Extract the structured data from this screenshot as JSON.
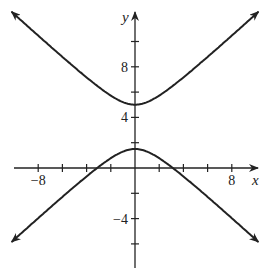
{
  "chart_data": {
    "type": "line",
    "title": "",
    "xlabel": "x",
    "ylabel": "y",
    "xlim": [
      -10.5,
      10.5
    ],
    "ylim": [
      -8,
      12.5
    ],
    "x_ticks": [
      -8,
      -6,
      -4,
      -2,
      2,
      4,
      6,
      8
    ],
    "y_ticks": [
      -6,
      -4,
      -2,
      2,
      4,
      6,
      8,
      10
    ],
    "x_tick_labels": [
      {
        "value": -8,
        "label": "−8"
      },
      {
        "value": 8,
        "label": "8"
      }
    ],
    "y_tick_labels": [
      {
        "value": 8,
        "label": "8"
      },
      {
        "value": 4,
        "label": "4"
      },
      {
        "value": -4,
        "label": "−4"
      }
    ],
    "grid": false,
    "series": [
      {
        "name": "upper branch",
        "description": "hyperbola branch opening upward, vertex (0,5)",
        "vertex": [
          0,
          5
        ]
      },
      {
        "name": "lower branch",
        "description": "hyperbola branch opening downward, vertex (0,1.5)",
        "vertex": [
          0,
          1.5
        ]
      }
    ],
    "hyperbola": {
      "center": [
        0,
        3.25
      ],
      "a": 1.75,
      "b": 2
    }
  }
}
